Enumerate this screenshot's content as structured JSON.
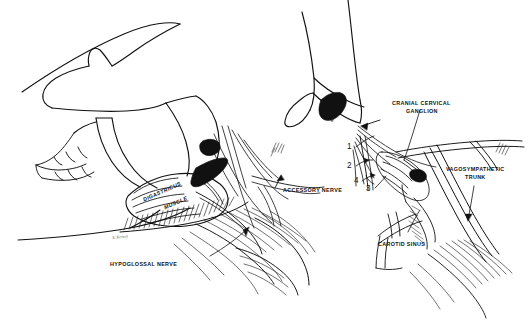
{
  "figure": {
    "kind": "anatomical-line-drawing",
    "background_color": "#ffffff",
    "ink_color": "#111111",
    "width": 531,
    "height": 327
  },
  "labels": {
    "accessory_nerve": "ACCESSORY NERVE",
    "hypoglossal_nerve": "HYPOGLOSSAL NERVE",
    "digastricus_muscle_line1": "DIGASTRICUS",
    "digastricus_muscle_line2": "MUSCLE",
    "tympanic_bulla_line1": "TYMPANIC",
    "tympanic_bulla_line2": "BULLA",
    "cranial_cervical_ganglion_line1": "CRANIAL CERVICAL",
    "cranial_cervical_ganglion_line2": "GANGLION",
    "vagosympathetic_trunk_line1": "VAGOSYMPATHETIC",
    "vagosympathetic_trunk_line2": "TRUNK",
    "carotid_sinus": "CAROTID SINUS"
  },
  "callout_numbers": {
    "one": "1",
    "two": "2",
    "three": "3",
    "four": "4"
  },
  "signature": "S. Kersey"
}
